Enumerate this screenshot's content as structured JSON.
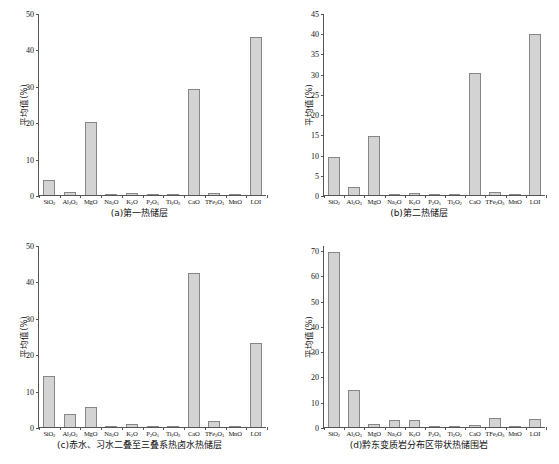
{
  "figure": {
    "ylabel": "平均值(%)",
    "categories": [
      "SiO2",
      "Al2O3",
      "MgO",
      "Na2O",
      "K2O",
      "P2O5",
      "Ti2O2",
      "CaO",
      "TFe2O3",
      "MnO",
      "LOI"
    ],
    "category_labels": [
      "SiO₂",
      "Al₂O₃",
      "MgO",
      "Na₂O",
      "K₂O",
      "P₂O₅",
      "Ti₂O₂",
      "CaO",
      "TFe₂O₃",
      "MnO",
      "LOI"
    ],
    "bar_fill": "#d3d3d3",
    "bar_stroke": "#868686",
    "axis_color": "#555555"
  },
  "panels": [
    {
      "id": "a",
      "caption": "(a)第一热储层",
      "ylabel": "平均值(%)",
      "ylim": [
        0,
        50
      ],
      "yticks": [
        0,
        10,
        20,
        30,
        40,
        50
      ],
      "ytick_labels": [
        "0",
        "10",
        "20",
        "30",
        "40",
        "50"
      ],
      "values": [
        4.1,
        0.8,
        20.0,
        0.15,
        0.6,
        0.3,
        0.1,
        29.2,
        0.5,
        0.05,
        43.5
      ]
    },
    {
      "id": "b",
      "caption": "(b)第二热储层",
      "ylabel": "平均值(%)",
      "ylim": [
        0,
        45
      ],
      "yticks": [
        0,
        5,
        10,
        15,
        20,
        25,
        30,
        35,
        40,
        45
      ],
      "ytick_labels": [
        "0",
        "5",
        "10",
        "15",
        "20",
        "25",
        "30",
        "35",
        "40",
        "45"
      ],
      "values": [
        9.5,
        2.1,
        14.6,
        0.2,
        0.6,
        0.05,
        0.15,
        30.1,
        0.8,
        0.05,
        39.7
      ]
    },
    {
      "id": "c",
      "caption": "(c)赤水、习水二叠至三叠系热卤水热储层",
      "ylabel": "平均值(%)",
      "ylim": [
        0,
        50
      ],
      "yticks": [
        0,
        10,
        20,
        30,
        40,
        50
      ],
      "ytick_labels": [
        "0",
        "10",
        "20",
        "30",
        "40",
        "50"
      ],
      "values": [
        14.0,
        3.5,
        5.4,
        0.2,
        0.8,
        0.15,
        0.35,
        42.3,
        1.7,
        0.05,
        23.0
      ]
    },
    {
      "id": "d",
      "caption": "(d)黔东变质岩分布区带状热储围岩",
      "ylabel": "平均值(%)",
      "ylim": [
        0,
        72
      ],
      "yticks": [
        0,
        10,
        20,
        30,
        40,
        50,
        60,
        70
      ],
      "ytick_labels": [
        "0",
        "10",
        "20",
        "30",
        "40",
        "50",
        "60",
        "70"
      ],
      "values": [
        69.3,
        14.8,
        1.0,
        2.7,
        2.7,
        0.1,
        0.5,
        0.8,
        3.6,
        0.2,
        3.1
      ]
    }
  ],
  "chart_data": {
    "type": "bar",
    "title": "",
    "xlabel": "",
    "ylabel": "平均值(%)",
    "grid": false,
    "legend": "none",
    "categories": [
      "SiO₂",
      "Al₂O₃",
      "MgO",
      "Na₂O",
      "K₂O",
      "P₂O₅",
      "Ti₂O₂",
      "CaO",
      "TFe₂O₃",
      "MnO",
      "LOI"
    ],
    "subplots": [
      {
        "label": "(a)第一热储层",
        "ylim": [
          0,
          50
        ],
        "yticks": [
          0,
          10,
          20,
          30,
          40,
          50
        ],
        "values": [
          4.1,
          0.8,
          20.0,
          0.15,
          0.6,
          0.3,
          0.1,
          29.2,
          0.5,
          0.05,
          43.5
        ]
      },
      {
        "label": "(b)第二热储层",
        "ylim": [
          0,
          45
        ],
        "yticks": [
          0,
          5,
          10,
          15,
          20,
          25,
          30,
          35,
          40,
          45
        ],
        "values": [
          9.5,
          2.1,
          14.6,
          0.2,
          0.6,
          0.05,
          0.15,
          30.1,
          0.8,
          0.05,
          39.7
        ]
      },
      {
        "label": "(c)赤水、习水二叠至三叠系热卤水热储层",
        "ylim": [
          0,
          50
        ],
        "yticks": [
          0,
          10,
          20,
          30,
          40,
          50
        ],
        "values": [
          14.0,
          3.5,
          5.4,
          0.2,
          0.8,
          0.15,
          0.35,
          42.3,
          1.7,
          0.05,
          23.0
        ]
      },
      {
        "label": "(d)黔东变质岩分布区带状热储围岩",
        "ylim": [
          0,
          72
        ],
        "yticks": [
          0,
          10,
          20,
          30,
          40,
          50,
          60,
          70
        ],
        "values": [
          69.3,
          14.8,
          1.0,
          2.7,
          2.7,
          0.1,
          0.5,
          0.8,
          3.6,
          0.2,
          3.1
        ]
      }
    ]
  }
}
